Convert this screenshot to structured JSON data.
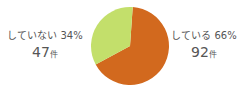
{
  "chart_data": {
    "type": "pie",
    "title": "",
    "categories": [
      "している",
      "していない"
    ],
    "values": [
      66,
      34
    ],
    "counts": [
      92,
      47
    ],
    "unit": "件",
    "percent_suffix": "%",
    "legend_position": "outside-labels",
    "colors": {
      "している": "#d2691e",
      "していない": "#c3df6b"
    },
    "background": "#ffffff",
    "text_color": "#555555",
    "slices": [
      {
        "label": "している",
        "percent_text": "66%",
        "count_text": "92",
        "unit_text": "件",
        "color": "#d2691e",
        "start_angle_deg": 4,
        "sweep_deg": 237.6
      },
      {
        "label": "していない",
        "percent_text": "34%",
        "count_text": "47",
        "unit_text": "件",
        "color": "#c3df6b",
        "start_angle_deg": 241.6,
        "sweep_deg": 122.4
      }
    ]
  },
  "labels": {
    "left": {
      "title": "していない 34%",
      "number": "47",
      "unit": "件"
    },
    "right": {
      "title": "している 66%",
      "number": "92",
      "unit": "件"
    }
  }
}
